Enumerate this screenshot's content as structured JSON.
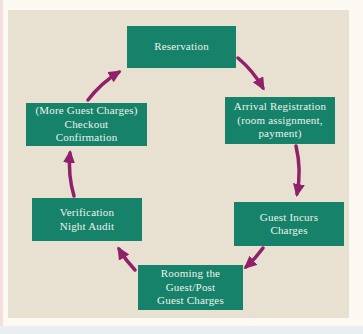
{
  "figure": {
    "type": "cycle-diagram",
    "subject": "hotel-guest-cycle",
    "nodes": [
      {
        "id": "reservation",
        "label": "Reservation"
      },
      {
        "id": "arrival-registration",
        "label": "Arrival Registration\n(room assignment,\npayment)"
      },
      {
        "id": "guest-incurs-charges",
        "label": "Guest Incurs\nCharges"
      },
      {
        "id": "rooming-guest-post",
        "label": "Rooming the\nGuest/Post\nGuest Charges"
      },
      {
        "id": "verification-night-audit",
        "label": "Verification\nNight Audit"
      },
      {
        "id": "checkout-confirmation",
        "label": "(More Guest Charges)\nCheckout\nConfirmation"
      }
    ],
    "flow_order": [
      "Reservation",
      "Arrival Registration (room assignment, payment)",
      "Guest Incurs Charges",
      "Rooming the Guest/Post Guest Charges",
      "Verification Night Audit",
      "(More Guest Charges) Checkout Confirmation"
    ],
    "colors": {
      "node_fill": "#16826a",
      "node_text": "#ecf2eb",
      "arrow": "#8f2069",
      "panel_bg": "#e8e0d0",
      "page_bg": "#fbf9f1",
      "strip_pink": "#f3dedb",
      "strip_blue": "#e9eef3"
    }
  }
}
